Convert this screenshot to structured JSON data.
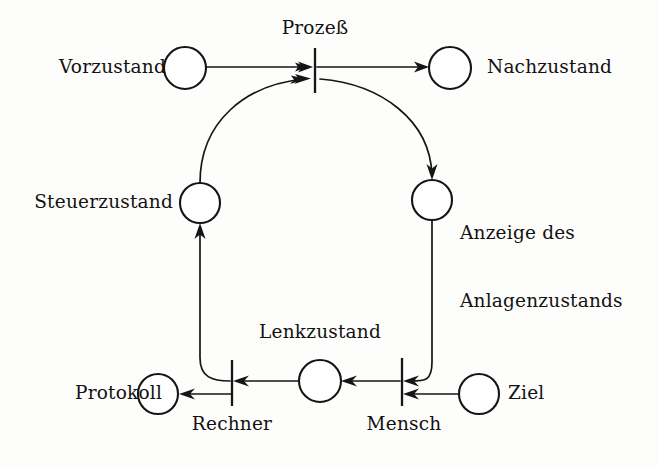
{
  "diagram": {
    "background_color": "#fdfdfb",
    "ink_color": "#151515",
    "places": [
      {
        "id": "vorzustand",
        "label": "Vorzustand",
        "cx": 185,
        "cy": 68,
        "r": 21,
        "label_side": "left"
      },
      {
        "id": "nachzustand",
        "label": "Nachzustand",
        "cx": 450,
        "cy": 68,
        "r": 21,
        "label_side": "right"
      },
      {
        "id": "steuerzustand",
        "label": "Steuerzustand",
        "cx": 200,
        "cy": 203,
        "r": 20,
        "label_side": "left"
      },
      {
        "id": "anzeige",
        "label": "Anzeige des\nAnlagenzustands",
        "cx": 432,
        "cy": 200,
        "r": 20,
        "label_side": "right"
      },
      {
        "id": "protokoll",
        "label": "Protokoll",
        "cx": 158,
        "cy": 394,
        "r": 20,
        "label_side": "left"
      },
      {
        "id": "lenkzustand",
        "label": "Lenkzustand",
        "cx": 320,
        "cy": 381,
        "r": 21,
        "label_side": "top"
      },
      {
        "id": "ziel",
        "label": "Ziel",
        "cx": 479,
        "cy": 394,
        "r": 20,
        "label_side": "right"
      }
    ],
    "transitions": [
      {
        "id": "prozess",
        "label": "Prozeß",
        "x": 315,
        "y_top": 48,
        "y_bottom": 93,
        "label_side": "top"
      },
      {
        "id": "rechner",
        "label": "Rechner",
        "x": 232,
        "y_top": 360,
        "y_bottom": 406,
        "label_side": "bottom"
      },
      {
        "id": "mensch",
        "label": "Mensch",
        "x": 402,
        "y_top": 358,
        "y_bottom": 406,
        "label_side": "bottom"
      }
    ],
    "arcs": [
      {
        "id": "vorzustand-to-prozess",
        "from": "vorzustand",
        "to": "prozess"
      },
      {
        "id": "prozess-to-nachzustand",
        "from": "prozess",
        "to": "nachzustand"
      },
      {
        "id": "steuerzustand-to-prozess",
        "from": "steuerzustand",
        "to": "prozess"
      },
      {
        "id": "prozess-to-anzeige",
        "from": "prozess",
        "to": "anzeige"
      },
      {
        "id": "anzeige-to-mensch",
        "from": "anzeige",
        "to": "mensch"
      },
      {
        "id": "ziel-to-mensch",
        "from": "ziel",
        "to": "mensch"
      },
      {
        "id": "mensch-to-lenkzustand",
        "from": "mensch",
        "to": "lenkzustand"
      },
      {
        "id": "lenkzustand-to-rechner",
        "from": "lenkzustand",
        "to": "rechner"
      },
      {
        "id": "rechner-to-protokoll",
        "from": "rechner",
        "to": "protokoll"
      },
      {
        "id": "rechner-to-steuerzustand",
        "from": "rechner",
        "to": "steuerzustand"
      }
    ],
    "labels": {
      "vorzustand": "Vorzustand",
      "nachzustand": "Nachzustand",
      "prozess": "Prozeß",
      "steuerzustand": "Steuerzustand",
      "anzeige_line1": "Anzeige des",
      "anzeige_line2": "Anlagenzustands",
      "lenkzustand": "Lenkzustand",
      "protokoll": "Protokoll",
      "rechner": "Rechner",
      "mensch": "Mensch",
      "ziel": "Ziel"
    }
  }
}
